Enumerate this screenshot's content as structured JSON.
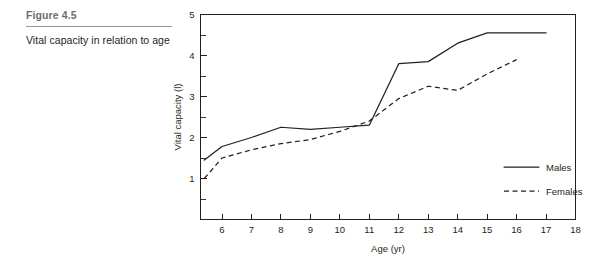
{
  "caption": {
    "figure_number": "Figure 4.5",
    "text": "Vital capacity in relation to age"
  },
  "chart_data": {
    "type": "line",
    "title": "",
    "xlabel": "Age (yr)",
    "ylabel": "Vital capacity (l)",
    "xlim": [
      5,
      18
    ],
    "ylim": [
      0,
      5
    ],
    "xticks": [
      6,
      7,
      8,
      9,
      10,
      11,
      12,
      13,
      14,
      15,
      16,
      17,
      18
    ],
    "xtick_labels": [
      "6",
      "7",
      "8",
      "9",
      "10",
      "11",
      "12",
      "13",
      "14",
      "15",
      "16",
      "17",
      "18"
    ],
    "yticks": [
      1,
      2,
      3,
      4,
      5
    ],
    "ytick_labels": [
      "1",
      "2",
      "3",
      "4",
      "5"
    ],
    "yticks_minor": [
      0.5,
      1.5,
      2.5,
      3.5,
      4.5
    ],
    "grid": false,
    "legend_position": "right-inside",
    "series": [
      {
        "name": "Males",
        "style": "solid",
        "x": [
          5.4,
          6,
          7,
          8,
          9,
          10,
          11,
          12,
          13,
          14,
          15,
          16,
          17
        ],
        "values": [
          1.45,
          1.78,
          2.0,
          2.25,
          2.2,
          2.25,
          2.3,
          3.8,
          3.85,
          4.3,
          4.55,
          4.55,
          4.55
        ]
      },
      {
        "name": "Females",
        "style": "dashed",
        "x": [
          5.4,
          6,
          7,
          8,
          9,
          10,
          11,
          12,
          13,
          14,
          15,
          16
        ],
        "values": [
          1.0,
          1.5,
          1.7,
          1.85,
          1.95,
          2.15,
          2.4,
          2.95,
          3.25,
          3.15,
          3.55,
          3.9
        ]
      }
    ]
  },
  "legend": {
    "items": [
      {
        "label": "Males",
        "style": "solid"
      },
      {
        "label": "Females",
        "style": "dashed"
      }
    ]
  }
}
